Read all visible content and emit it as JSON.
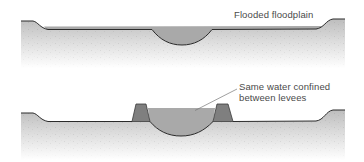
{
  "figure": {
    "type": "cross-section diagram"
  },
  "panels": [
    {
      "id": "top",
      "description": "Natural channel during flood: water spreads across floodplain",
      "label": "Flooded floodplain"
    },
    {
      "id": "bottom",
      "description": "Channel with levees: same water volume confined, higher water level",
      "label_line1": "Same water confined",
      "label_line2": "between levees"
    }
  ],
  "colors": {
    "water": "#a9a9a9",
    "levee": "#7f7f7f",
    "ground_top": "#c4c4c4",
    "ground_fade": "#ffffff",
    "outline": "#2b2b2b",
    "label_text": "#4a4a4a",
    "leader_line": "#777777"
  }
}
